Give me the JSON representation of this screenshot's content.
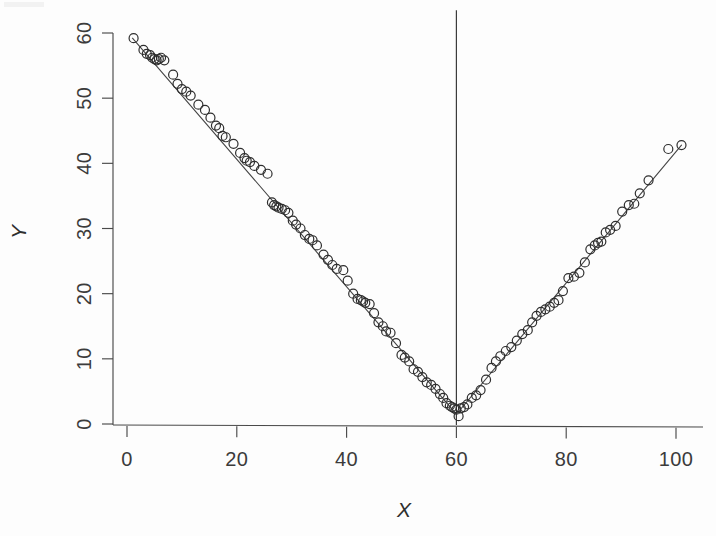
{
  "figure": {
    "background_color": "#fdfdfd",
    "ink_color": "#2e2e2e",
    "axis_color": "#4a4a4a"
  },
  "axes": {
    "x_title": "X",
    "y_title": "Y",
    "x_ticks": [
      "0",
      "20",
      "40",
      "60",
      "80",
      "100"
    ],
    "y_ticks": [
      "0",
      "10",
      "20",
      "30",
      "40",
      "50",
      "60"
    ]
  },
  "chart_data": {
    "type": "scatter",
    "title": "",
    "subtitle": "",
    "xlabel": "X",
    "ylabel": "Y",
    "xlim": [
      -2,
      105
    ],
    "ylim": [
      -1.5,
      61
    ],
    "xticks": [
      0,
      20,
      40,
      60,
      80,
      100
    ],
    "yticks": [
      0,
      10,
      20,
      30,
      40,
      50,
      60
    ],
    "grid": false,
    "legend": null,
    "legend_position": "none",
    "marker": "open-circle",
    "marker_size_px": 9,
    "annotations": [
      {
        "type": "vertical-line",
        "x": 60,
        "label": "breakpoint reference line at X = 60",
        "y_from": 0,
        "y_to": 63.5
      },
      {
        "type": "fitted-line",
        "shape": "v-shaped piecewise linear",
        "vertex": [
          60,
          1.5
        ],
        "left_segment": {
          "from": [
            1,
            59.2
          ],
          "to": [
            60,
            1.5
          ],
          "slope": -0.978
        },
        "right_segment": {
          "from": [
            60,
            1.5
          ],
          "to": [
            101,
            42.8
          ],
          "slope": 1.007
        }
      }
    ],
    "series": [
      {
        "name": "observations",
        "n": 120,
        "x": [
          1.2,
          3.0,
          3.6,
          4.2,
          4.6,
          5.0,
          5.4,
          5.8,
          6.2,
          6.8,
          8.4,
          9.2,
          10.0,
          10.8,
          11.6,
          13.0,
          14.2,
          15.2,
          16.2,
          16.8,
          17.4,
          18.0,
          19.4,
          20.6,
          21.4,
          21.8,
          22.4,
          23.2,
          24.4,
          25.6,
          26.4,
          26.8,
          27.2,
          27.6,
          28.2,
          28.8,
          29.4,
          30.2,
          30.8,
          31.6,
          32.4,
          33.2,
          33.8,
          34.6,
          35.8,
          36.6,
          37.4,
          38.2,
          39.4,
          40.2,
          41.2,
          42.0,
          42.6,
          43.0,
          43.4,
          44.2,
          45.0,
          45.8,
          46.6,
          47.2,
          48.0,
          49.0,
          50.0,
          50.6,
          51.4,
          52.2,
          53.0,
          53.8,
          54.6,
          55.4,
          56.2,
          57.0,
          57.6,
          58.2,
          58.8,
          59.2,
          59.6,
          60.0,
          60.4,
          60.8,
          61.4,
          62.0,
          62.8,
          63.6,
          64.4,
          65.4,
          66.4,
          67.2,
          68.0,
          69.0,
          70.0,
          71.0,
          72.0,
          73.0,
          73.8,
          74.6,
          75.4,
          76.2,
          77.0,
          77.8,
          78.6,
          79.4,
          80.4,
          81.4,
          82.4,
          83.4,
          84.4,
          85.2,
          85.8,
          86.4,
          87.2,
          88.0,
          89.0,
          90.2,
          91.4,
          92.4,
          93.4,
          95.0,
          98.6,
          101.0
        ],
        "y": [
          59.2,
          57.4,
          56.8,
          56.6,
          56.2,
          56.0,
          55.8,
          56.0,
          56.2,
          55.8,
          53.6,
          52.2,
          51.4,
          51.0,
          50.4,
          49.0,
          48.2,
          47.0,
          45.8,
          45.4,
          44.2,
          44.0,
          43.0,
          41.6,
          40.8,
          40.4,
          40.2,
          39.6,
          39.0,
          38.4,
          34.0,
          33.6,
          33.4,
          33.2,
          33.0,
          32.8,
          32.4,
          31.2,
          30.6,
          30.0,
          29.0,
          28.4,
          28.2,
          27.4,
          26.0,
          25.2,
          24.4,
          23.8,
          23.6,
          22.0,
          20.0,
          19.2,
          19.0,
          18.8,
          18.6,
          18.4,
          17.0,
          15.6,
          15.0,
          14.2,
          14.0,
          12.4,
          10.6,
          10.2,
          9.6,
          8.4,
          8.0,
          7.2,
          6.4,
          6.0,
          5.4,
          4.6,
          4.0,
          3.2,
          2.8,
          2.6,
          2.4,
          2.2,
          1.2,
          2.4,
          2.6,
          3.0,
          4.0,
          4.4,
          5.2,
          6.8,
          8.6,
          9.6,
          10.4,
          11.2,
          11.8,
          12.8,
          13.8,
          14.4,
          15.6,
          16.6,
          17.2,
          17.6,
          18.0,
          18.6,
          19.0,
          20.4,
          22.4,
          22.6,
          23.2,
          24.8,
          26.8,
          27.4,
          27.8,
          28.0,
          29.4,
          29.8,
          30.4,
          32.6,
          33.6,
          33.8,
          35.4,
          37.4,
          42.2,
          42.8
        ]
      }
    ]
  }
}
